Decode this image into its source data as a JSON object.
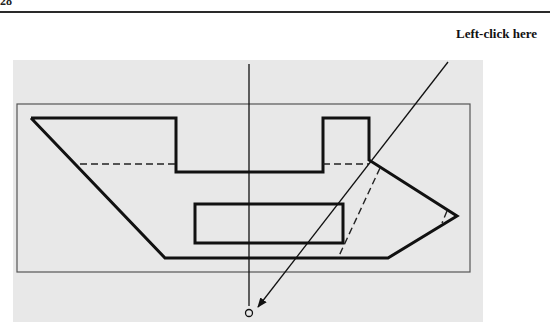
{
  "page": {
    "page_number": "28",
    "callout_label": "Left-click here"
  },
  "drawing": {
    "background_color": "#e8e8e8",
    "line_color": "#111111",
    "frame_color": "#555555",
    "viewport": {
      "x": 13,
      "y": 60,
      "width": 470,
      "height": 262
    },
    "frame": {
      "x": 17,
      "y": 104,
      "width": 453,
      "height": 168
    },
    "outline_points": "31,118 176,118 176,172 323,172 323,118 369,118 369,160 457,216 388,258 165,258 31,118",
    "inner_rect": {
      "x": 195,
      "y": 204,
      "width": 148,
      "height": 39
    },
    "hidden_lines": [
      {
        "x1": 80,
        "y1": 164,
        "x2": 176,
        "y2": 164
      },
      {
        "x1": 323,
        "y1": 164,
        "x2": 369,
        "y2": 164
      },
      {
        "x1": 380,
        "y1": 168,
        "x2": 338,
        "y2": 258
      },
      {
        "x1": 447,
        "y1": 211,
        "x2": 442,
        "y2": 223
      }
    ],
    "centerline": {
      "x": 249,
      "y1": 64,
      "y2": 306
    },
    "pick_point": {
      "cx": 249,
      "cy": 313,
      "r": 3.5
    },
    "leader": {
      "x1": 448,
      "y1": 62,
      "x2": 258,
      "y2": 307
    }
  }
}
